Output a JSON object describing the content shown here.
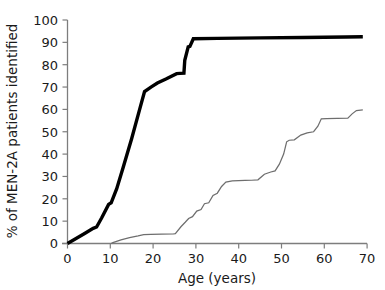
{
  "chart_data": {
    "type": "line",
    "title": "",
    "xlabel": "Age (years)",
    "ylabel": "% of MEN-2A patients identified",
    "xlim": [
      0,
      70
    ],
    "ylim": [
      0,
      100
    ],
    "xticks": [
      0,
      10,
      20,
      30,
      40,
      50,
      60,
      70
    ],
    "yticks": [
      0,
      10,
      20,
      30,
      40,
      50,
      60,
      70,
      80,
      90,
      100
    ],
    "xtick_labels": [
      "0",
      "10",
      "20",
      "30",
      "40",
      "50",
      "60",
      "70"
    ],
    "ytick_labels": [
      "0",
      "10",
      "20",
      "30",
      "40",
      "50",
      "60",
      "70",
      "80",
      "90",
      "100"
    ],
    "grid": false,
    "legend": "none",
    "series": [
      {
        "name": "screened-carriers-thick",
        "style": "thick-black",
        "color": "#000000",
        "x": [
          0,
          2,
          4,
          6,
          6.8,
          8,
          9.6,
          10.2,
          11.5,
          13,
          15,
          17,
          18,
          19.5,
          21,
          23,
          25.5,
          26.3,
          27.2,
          27.4,
          28.2,
          28.6,
          29.4,
          35,
          45,
          55,
          65,
          69
        ],
        "y": [
          0,
          2.2,
          4.5,
          6.8,
          7.4,
          11.5,
          17.5,
          18.2,
          24.5,
          34,
          47,
          61,
          68,
          70,
          71.8,
          73.6,
          76,
          76.1,
          76.2,
          82,
          88,
          88.2,
          91.6,
          91.8,
          92.0,
          92.2,
          92.4,
          92.5
        ]
      },
      {
        "name": "index-cases-thin",
        "style": "thin-grey",
        "color": "#6e6e6e",
        "x": [
          10.2,
          10.6,
          12.5,
          14.5,
          16.5,
          17.8,
          19.5,
          22,
          24.8,
          25.2,
          26.5,
          27.5,
          28.3,
          29.2,
          30.2,
          31.2,
          32,
          33,
          34,
          35,
          36,
          37,
          38.5,
          40,
          41.5,
          43,
          44.5,
          46,
          47.5,
          48.5,
          49.5,
          50.5,
          51.2,
          51.8,
          53,
          54.5,
          56,
          57.5,
          58.5,
          59.3,
          60.5,
          63,
          65.5,
          66.5,
          67.5,
          68.5,
          69
        ],
        "y": [
          0,
          0.4,
          1.6,
          2.6,
          3.4,
          4.0,
          4.1,
          4.2,
          4.3,
          4.4,
          7.5,
          9.5,
          11.2,
          12.0,
          14.5,
          15.2,
          17.8,
          18.2,
          21.5,
          22.5,
          25.5,
          27.5,
          28.0,
          28.1,
          28.2,
          28.3,
          28.5,
          31.0,
          32.0,
          32.5,
          35.5,
          40.0,
          45.5,
          46.2,
          46.4,
          48.5,
          49.5,
          50.0,
          52.5,
          55.8,
          55.9,
          56.0,
          56.1,
          58.0,
          59.5,
          59.7,
          59.8
        ]
      }
    ]
  },
  "axes": {
    "spine_color": "#7d7d7d",
    "text_color": "#1a1a1a"
  }
}
